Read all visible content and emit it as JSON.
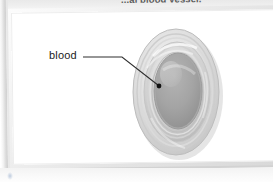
{
  "document": {
    "caption_partial": "...al blood vessel.",
    "page_background_color": "#ffffff",
    "frame_border_color": "#dcdcdc",
    "panel_fill_color": "#ffffff"
  },
  "figure": {
    "name": "blood-vessel-cross-section",
    "label": "blood",
    "label_text_color": "#1c1c1c",
    "leader_line_color": "#2a2a2a",
    "pointer_dot_color": "#111111",
    "lumen_color": "#9e9e9e",
    "wall_outer_color": "#d6d6d6",
    "wall_mid_color": "#c2c2c2",
    "wall_inner_color": "#b0b0b0",
    "highlight_color": "#f2f2f2"
  },
  "annotations": {
    "leader_horizontal_y": 57,
    "leader_bend_x": 122,
    "pointer_tip_x": 159,
    "pointer_tip_y": 86
  }
}
